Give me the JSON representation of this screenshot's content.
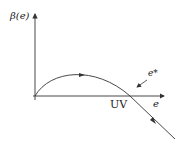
{
  "diagram": {
    "y_axis_label": "β(e)",
    "x_axis_label": "e",
    "fixed_point_label": "UV",
    "annotation_label": "e*",
    "stroke_color": "#333333"
  }
}
